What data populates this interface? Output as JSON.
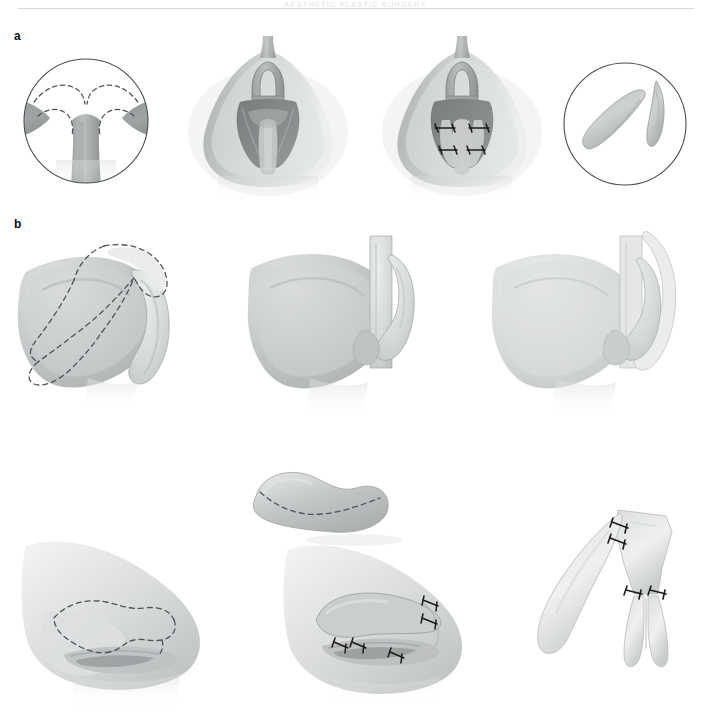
{
  "running_head": {
    "text": "AESTHETIC PLASTIC SURGERY"
  },
  "figure": {
    "panels": [
      {
        "letter": "a",
        "name": "panel-a",
        "subpanels": [
          {
            "name": "endonasal-inset-view",
            "caption": ""
          },
          {
            "name": "nasal-base-view-preop",
            "caption": ""
          },
          {
            "name": "nasal-base-view-sutured",
            "caption": ""
          },
          {
            "name": "cartilage-graft-inset",
            "caption": ""
          }
        ]
      },
      {
        "letter": "b",
        "name": "panel-b",
        "subpanels": [
          {
            "name": "ear-graft-outline",
            "caption": ""
          },
          {
            "name": "ear-after-harvest",
            "caption": ""
          },
          {
            "name": "ear-closed",
            "caption": ""
          },
          {
            "name": "composite-graft",
            "caption": ""
          },
          {
            "name": "lateral-nose-marking",
            "caption": ""
          },
          {
            "name": "lateral-nose-graft-inset",
            "caption": ""
          },
          {
            "name": "cartilage-framework-sutured",
            "caption": ""
          }
        ]
      }
    ]
  },
  "colors": {
    "skin_mid": "#b9bcbc",
    "skin_light": "#d9dcdc",
    "skin_pale": "#e8eaea",
    "mucosa": "#8f9394",
    "mucosa_dark": "#7b7f80",
    "outline": "#5b5f61",
    "dashed": "#4f5355",
    "suture": "#1b1b1b",
    "rule": "#d8d8da",
    "head_text": "#e2e2e4",
    "background": "#ffffff"
  },
  "labels": {
    "letter_a": "a",
    "letter_b": "b"
  }
}
